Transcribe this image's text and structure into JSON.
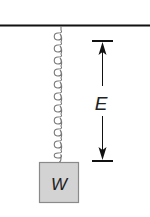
{
  "diagram": {
    "ceiling": {
      "label": ""
    },
    "spring": {
      "coils": 11
    },
    "weight": {
      "label": "W",
      "fill": "#d3d3d3",
      "stroke": "#8a8a8a"
    },
    "dimension": {
      "label": "E"
    },
    "colors": {
      "line": "#111111",
      "spring": "#777777"
    }
  }
}
